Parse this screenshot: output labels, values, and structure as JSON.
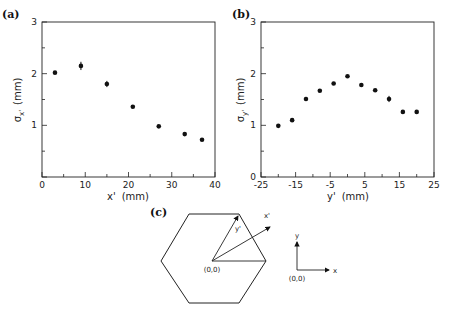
{
  "chart_data": [
    {
      "panel": "(a)",
      "type": "scatter",
      "xlabel": "x' (mm)",
      "ylabel": "σx' (mm)",
      "xlim": [
        0,
        40
      ],
      "ylim": [
        0,
        3
      ],
      "xticks": [
        0,
        10,
        20,
        30,
        40
      ],
      "yticks": [
        1,
        2,
        3
      ],
      "x": [
        3,
        9,
        15,
        21,
        27,
        33,
        37
      ],
      "y": [
        2.02,
        2.15,
        1.8,
        1.36,
        0.98,
        0.83,
        0.72
      ],
      "yerr": [
        0.03,
        0.08,
        0.06,
        0.03,
        0.03,
        0.03,
        0.03
      ],
      "grid": false
    },
    {
      "panel": "(b)",
      "type": "scatter",
      "xlabel": "y' (mm)",
      "ylabel": "σy' (mm)",
      "xlim": [
        -25,
        25
      ],
      "ylim": [
        0,
        3
      ],
      "xticks": [
        -25,
        -15,
        -5,
        5,
        15,
        25
      ],
      "yticks": [
        0,
        1,
        2,
        3
      ],
      "x": [
        -20,
        -16,
        -12,
        -8,
        -4,
        0,
        4,
        8,
        12,
        16,
        20
      ],
      "y": [
        0.99,
        1.1,
        1.51,
        1.67,
        1.81,
        1.95,
        1.78,
        1.68,
        1.51,
        1.26,
        1.26
      ],
      "yerr": [
        0.03,
        0.03,
        0.04,
        0.03,
        0.03,
        0.03,
        0.03,
        0.03,
        0.06,
        0.03,
        0.03
      ],
      "grid": false
    }
  ],
  "panels": {
    "a": {
      "label": "(a)",
      "xlabel_main": "x'",
      "xlabel_unit": "(mm)",
      "ylabel_sym": "σ",
      "ylabel_sub": "x'",
      "ylabel_unit": "(mm)",
      "xtick_labels": [
        "0",
        "10",
        "20",
        "30",
        "40"
      ],
      "ytick_labels": [
        "1",
        "2",
        "3"
      ]
    },
    "b": {
      "label": "(b)",
      "xlabel_main": "y'",
      "xlabel_unit": "(mm)",
      "ylabel_sym": "σ",
      "ylabel_sub": "y'",
      "ylabel_unit": "(mm)",
      "xtick_labels": [
        "-25",
        "-15",
        "-5",
        "5",
        "15",
        "25"
      ],
      "ytick_labels": [
        "0",
        "1",
        "2",
        "3"
      ]
    },
    "c": {
      "label": "(c)",
      "origin_label": "(0,0)",
      "x_prime_label": "x'",
      "y_prime_label": "y'",
      "axes_origin_label": "(0,0)",
      "axes_x_label": "x",
      "axes_y_label": "y"
    }
  }
}
